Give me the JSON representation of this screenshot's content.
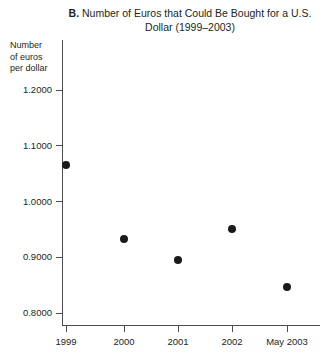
{
  "chart_data": {
    "type": "scatter",
    "title": "B. Number of Euros that Could Be Bought for a U.S. Dollar (1999–2003)",
    "title_letter": "B.",
    "title_text": " Number of Euros that Could Be Bought for a U.S. Dollar (1999–2003)",
    "xlabel": "",
    "ylabel": "Number of euros per dollar",
    "ylabel_lines": [
      "Number",
      "of euros",
      "per dollar"
    ],
    "categories": [
      "1999",
      "2000",
      "2001",
      "2002",
      "May 2003"
    ],
    "values": [
      1.0655,
      0.9327,
      0.8951,
      0.9507,
      0.8466
    ],
    "series": [
      {
        "name": "Euros per U.S. dollar",
        "values": [
          1.0655,
          0.9327,
          0.8951,
          0.9507,
          0.8466
        ]
      }
    ],
    "ylim": [
      0.8,
      1.2
    ],
    "yticks": [
      1.2,
      1.1,
      1.0,
      0.9,
      0.8
    ],
    "ytick_labels": [
      "1.2000",
      "1.1000",
      "1.0000",
      "0.9000",
      "0.8000"
    ],
    "xtick_labels": [
      "1999",
      "2000",
      "2001",
      "2002",
      "May 2003"
    ],
    "grid": false,
    "legend": false,
    "legend_position": "none",
    "marker": "filled-circle",
    "marker_color": "#1a1a1a",
    "axis_color": "#4d4d4f",
    "text_color": "#231f20",
    "background_color": "#ffffff"
  },
  "axes": {
    "y_ticks": [
      {
        "label": "1.2000",
        "value": 1.2
      },
      {
        "label": "1.1000",
        "value": 1.1
      },
      {
        "label": "1.0000",
        "value": 1.0
      },
      {
        "label": "0.9000",
        "value": 0.9
      },
      {
        "label": "0.8000",
        "value": 0.8
      }
    ],
    "x_ticks": [
      {
        "label": "1999"
      },
      {
        "label": "2000"
      },
      {
        "label": "2001"
      },
      {
        "label": "2002"
      },
      {
        "label": "May 2003"
      }
    ]
  }
}
